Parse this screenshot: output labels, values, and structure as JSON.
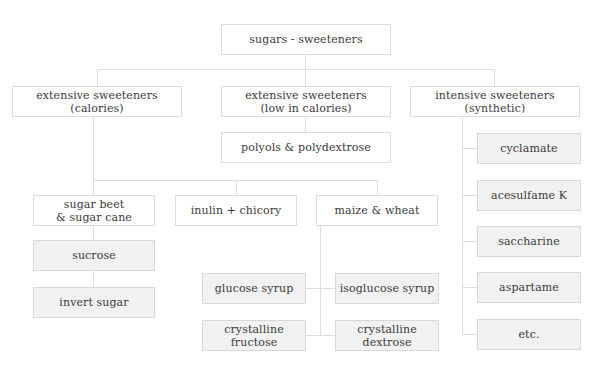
{
  "diagram": {
    "title": "sugars - sweeteners",
    "level1": [
      {
        "label": "extensive sweeteners\n(calories)"
      },
      {
        "label": "extensive sweeteners\n(low in calories)"
      },
      {
        "label": "intensive sweeteners\n(synthetic)"
      }
    ],
    "low_calorie_child": {
      "label": "polyols & polydextrose"
    },
    "calorie_sources": [
      {
        "label": "sugar beet\n& sugar cane"
      },
      {
        "label": "inulin + chicory"
      },
      {
        "label": "maize & wheat"
      }
    ],
    "beet_cane_products": [
      {
        "label": "sucrose"
      },
      {
        "label": "invert sugar"
      }
    ],
    "maize_wheat_products": [
      {
        "label": "glucose syrup"
      },
      {
        "label": "isoglucose syrup"
      },
      {
        "label": "crystalline\nfructose"
      },
      {
        "label": "crystalline\ndextrose"
      }
    ],
    "intensive_products": [
      {
        "label": "cyclamate"
      },
      {
        "label": "acesulfame K"
      },
      {
        "label": "saccharine"
      },
      {
        "label": "aspartame"
      },
      {
        "label": "etc."
      }
    ],
    "colors": {
      "box_border": "#dcdcdc",
      "shaded_fill": "#f1f1f1",
      "connector": "#dedede",
      "text": "#3a3a3a"
    }
  }
}
